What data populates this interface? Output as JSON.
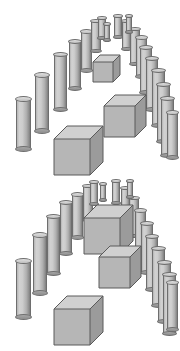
{
  "image": {
    "title": "Two 3D scenes of cylinders arranged in an arch with cubes",
    "width": 180,
    "height": 351,
    "background_color": "#ffffff",
    "panel_count": 2
  },
  "palette": {
    "cylinder_light": "#d2d2d2",
    "cylinder_mid": "#b4b4b4",
    "cylinder_dark": "#7d7d7d",
    "cylinder_outline": "#6e6e6e",
    "cube_top": "#d0d0d0",
    "cube_front": "#b6b6b6",
    "cube_side": "#9b9b9b",
    "cube_outline": "#5a5a5a"
  },
  "scenes": [
    {
      "id": "scene-top",
      "label": "Top scene",
      "y": 0,
      "height": 176,
      "cylinder_count": 19,
      "cube_count": 3,
      "cylinders": [
        {
          "x": 16,
          "y": 96,
          "w": 15,
          "h": 56
        },
        {
          "x": 35,
          "y": 72,
          "w": 14,
          "h": 62
        },
        {
          "x": 54,
          "y": 52,
          "w": 13,
          "h": 60
        },
        {
          "x": 69,
          "y": 39,
          "w": 12,
          "h": 52
        },
        {
          "x": 81,
          "y": 29,
          "w": 11,
          "h": 44
        },
        {
          "x": 91,
          "y": 19,
          "w": 10,
          "h": 34
        },
        {
          "x": 98,
          "y": 16,
          "w": 8,
          "h": 24
        },
        {
          "x": 114,
          "y": 14,
          "w": 8,
          "h": 25
        },
        {
          "x": 122,
          "y": 19,
          "w": 9,
          "h": 32
        },
        {
          "x": 130,
          "y": 27,
          "w": 10,
          "h": 39
        },
        {
          "x": 136,
          "y": 35,
          "w": 11,
          "h": 44
        },
        {
          "x": 140,
          "y": 45,
          "w": 12,
          "h": 50
        },
        {
          "x": 146,
          "y": 56,
          "w": 12,
          "h": 56
        },
        {
          "x": 152,
          "y": 68,
          "w": 13,
          "h": 60
        },
        {
          "x": 157,
          "y": 82,
          "w": 13,
          "h": 62
        },
        {
          "x": 161,
          "y": 96,
          "w": 13,
          "h": 62
        },
        {
          "x": 104,
          "y": 22,
          "w": 6,
          "h": 20
        },
        {
          "x": 126,
          "y": 14,
          "w": 6,
          "h": 20
        },
        {
          "x": 167,
          "y": 110,
          "w": 11,
          "h": 50
        }
      ],
      "cubes": [
        {
          "x": 93,
          "y": 55,
          "size": 20,
          "depth": 7,
          "name": "small-cube-apex"
        },
        {
          "x": 104,
          "y": 95,
          "size": 31,
          "depth": 11,
          "name": "medium-cube-center"
        },
        {
          "x": 54,
          "y": 126,
          "size": 36,
          "depth": 13,
          "name": "large-cube-lower-left"
        }
      ]
    },
    {
      "id": "scene-bottom",
      "label": "Bottom scene",
      "y": 176,
      "height": 175,
      "cylinder_count": 19,
      "cube_count": 3,
      "cylinders": [
        {
          "x": 16,
          "y": 82,
          "w": 15,
          "h": 62
        },
        {
          "x": 33,
          "y": 56,
          "w": 14,
          "h": 64
        },
        {
          "x": 47,
          "y": 38,
          "w": 13,
          "h": 62
        },
        {
          "x": 60,
          "y": 24,
          "w": 12,
          "h": 56
        },
        {
          "x": 72,
          "y": 16,
          "w": 11,
          "h": 48
        },
        {
          "x": 83,
          "y": 8,
          "w": 10,
          "h": 38
        },
        {
          "x": 90,
          "y": 4,
          "w": 8,
          "h": 26
        },
        {
          "x": 112,
          "y": 3,
          "w": 8,
          "h": 26
        },
        {
          "x": 121,
          "y": 10,
          "w": 9,
          "h": 34
        },
        {
          "x": 129,
          "y": 20,
          "w": 10,
          "h": 42
        },
        {
          "x": 135,
          "y": 32,
          "w": 11,
          "h": 48
        },
        {
          "x": 141,
          "y": 45,
          "w": 12,
          "h": 54
        },
        {
          "x": 146,
          "y": 58,
          "w": 12,
          "h": 58
        },
        {
          "x": 152,
          "y": 70,
          "w": 13,
          "h": 62
        },
        {
          "x": 158,
          "y": 84,
          "w": 13,
          "h": 64
        },
        {
          "x": 163,
          "y": 96,
          "w": 13,
          "h": 64
        },
        {
          "x": 100,
          "y": 6,
          "w": 6,
          "h": 20
        },
        {
          "x": 127,
          "y": 3,
          "w": 6,
          "h": 20
        },
        {
          "x": 167,
          "y": 104,
          "w": 11,
          "h": 52
        }
      ],
      "cubes": [
        {
          "x": 84,
          "y": 29,
          "size": 36,
          "depth": 13,
          "name": "large-cube-apex"
        },
        {
          "x": 99,
          "y": 70,
          "size": 31,
          "depth": 11,
          "name": "medium-cube-center"
        },
        {
          "x": 54,
          "y": 120,
          "size": 36,
          "depth": 13,
          "name": "large-cube-lower-left"
        }
      ]
    }
  ]
}
